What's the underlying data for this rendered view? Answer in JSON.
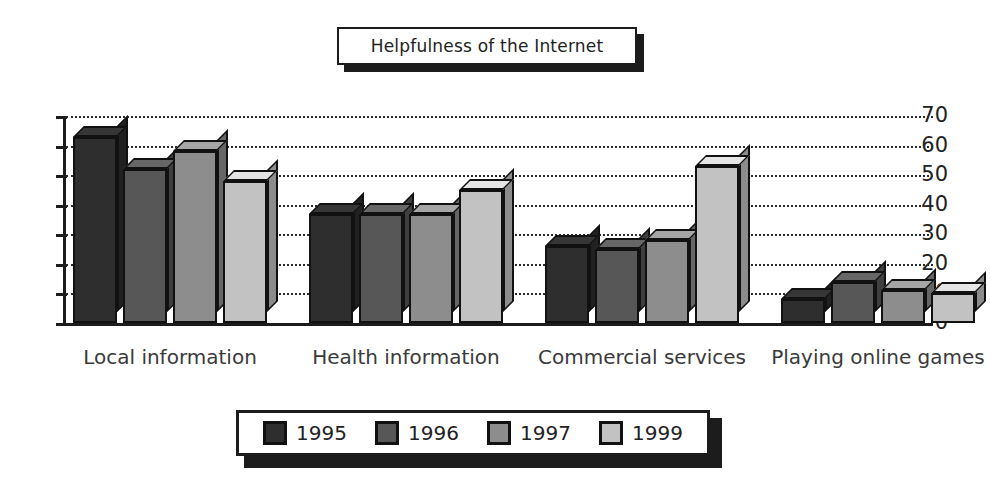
{
  "chart_data": {
    "type": "bar",
    "title": "Helpfulness of the Internet",
    "xlabel": "",
    "ylabel": "",
    "ylim": [
      0,
      70
    ],
    "ytick_step": 10,
    "yticks": [
      0,
      10,
      20,
      30,
      40,
      50,
      60,
      70
    ],
    "grid": true,
    "grid_style": "dotted horizontal",
    "legend_position": "bottom",
    "style": "3d-bar",
    "categories": [
      "Local information",
      "Health information",
      "Commercial services",
      "Playing online games"
    ],
    "series": [
      {
        "name": "1995",
        "color": "#2e2e2e",
        "values": [
          63,
          37,
          26,
          8
        ]
      },
      {
        "name": "1996",
        "color": "#575757",
        "values": [
          52,
          37,
          25,
          14
        ]
      },
      {
        "name": "1997",
        "color": "#8d8d8d",
        "values": [
          58,
          37,
          28,
          11
        ]
      },
      {
        "name": "1999",
        "color": "#c2c2c2",
        "values": [
          48,
          45,
          53,
          10
        ]
      }
    ]
  },
  "legend": {
    "items": [
      {
        "label": "1995"
      },
      {
        "label": "1996"
      },
      {
        "label": "1997"
      },
      {
        "label": "1999"
      }
    ]
  },
  "colors": {
    "axis": "#1c1c1c",
    "grid": "#2b2b2b",
    "background": "#ffffff",
    "text": "#222222"
  }
}
